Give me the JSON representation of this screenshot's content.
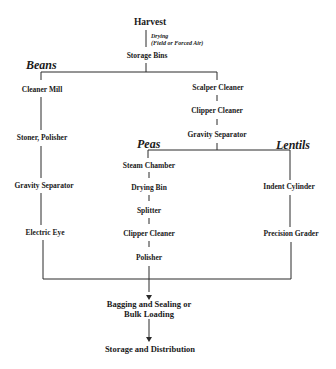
{
  "diagram": {
    "type": "flowchart",
    "start": "Harvest",
    "drying_note": {
      "line1": "Drying",
      "line2": "(Field or Forced Air)"
    },
    "storage_bins": "Storage Bins",
    "groups": {
      "beans": {
        "label": "Beans",
        "steps": [
          "Cleaner Mill",
          "Stoner, Polisher",
          "Gravity Separator",
          "Electric Eye"
        ]
      },
      "common": {
        "steps": [
          "Scalper Cleaner",
          "Clipper Cleaner",
          "Gravity Separator"
        ]
      },
      "peas": {
        "label": "Peas",
        "steps": [
          "Steam Chamber",
          "Drying Bin",
          "Splitter",
          "Clipper Cleaner",
          "Polisher"
        ]
      },
      "lentils": {
        "label": "Lentils",
        "steps": [
          "Indent Cylinder",
          "Precision Grader"
        ]
      }
    },
    "final": {
      "bagging_line1": "Bagging and Sealing or",
      "bagging_line2": "Bulk Loading",
      "storage": "Storage and Distribution"
    },
    "colors": {
      "line": "#2a2a2a",
      "text": "#1a1a1a",
      "background": "#ffffff"
    }
  }
}
